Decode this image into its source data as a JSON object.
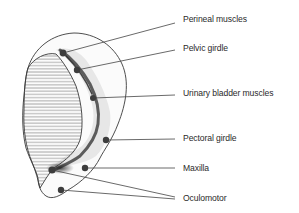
{
  "diagram": {
    "type": "anatomical-schematic",
    "labels": [
      {
        "id": "perineal",
        "text": "Perineal muscles",
        "x": 183,
        "y": 12,
        "point": [
          63,
          53
        ],
        "line_end": [
          175,
          23
        ]
      },
      {
        "id": "pelvic",
        "text": "Pelvic girdle",
        "x": 183,
        "y": 41,
        "point": [
          77,
          70
        ],
        "line_end": [
          175,
          50
        ]
      },
      {
        "id": "urinary",
        "text": "Urinary bladder muscles",
        "x": 183,
        "y": 86,
        "point": [
          93,
          98
        ],
        "line_end": [
          175,
          95
        ]
      },
      {
        "id": "pectoral",
        "text": "Pectoral girdle",
        "x": 183,
        "y": 130,
        "point": [
          106,
          140
        ],
        "line_end": [
          175,
          139
        ]
      },
      {
        "id": "maxilla",
        "text": "Maxilla",
        "x": 183,
        "y": 161,
        "point": [
          85,
          168
        ],
        "line_end": [
          175,
          168
        ]
      },
      {
        "id": "oculomotor",
        "text": "Oculomotor",
        "x": 183,
        "y": 191,
        "points": [
          [
            52,
            170
          ],
          [
            61,
            190
          ]
        ],
        "line_end": [
          175,
          198
        ]
      }
    ],
    "colors": {
      "outline": "#3a3a3a",
      "hatch": "#555555",
      "dot": "#3d3d3d",
      "line": "#444444",
      "text": "#2a2a2a"
    }
  }
}
